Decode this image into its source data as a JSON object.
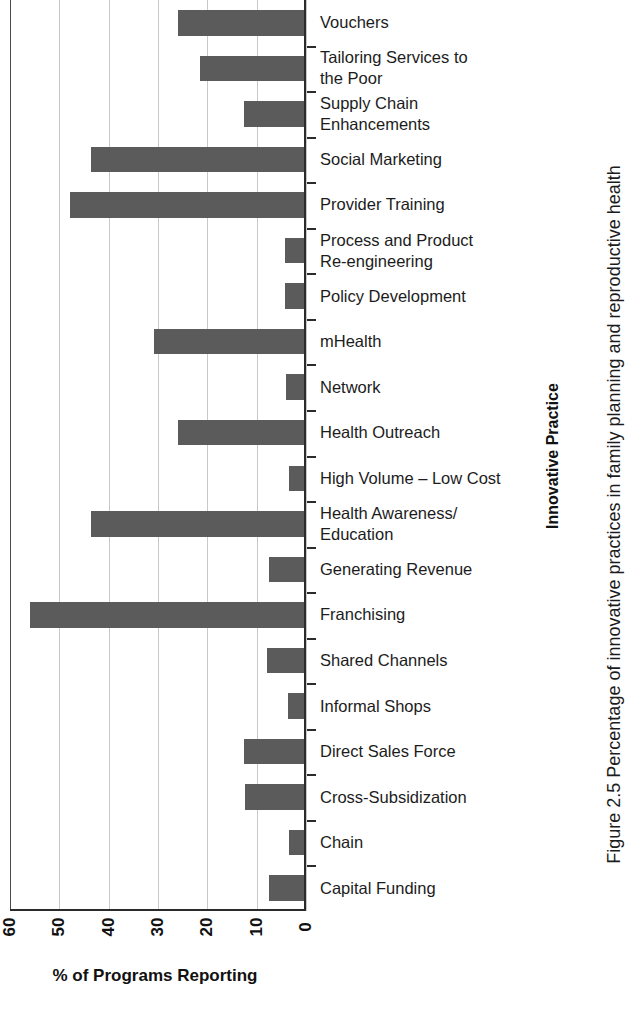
{
  "figure": {
    "caption": "Figure 2.5 Percentage of innovative practices in family planning and reproductive health"
  },
  "chart_data": {
    "type": "bar",
    "orientation": "horizontal",
    "title": "",
    "xlabel": "% of Programs Reporting",
    "ylabel": "Innovative Practice",
    "xlim": [
      60,
      0
    ],
    "x_axis_reversed": true,
    "xticks": [
      "60",
      "50",
      "40",
      "30",
      "20",
      "10",
      "0"
    ],
    "xtick_values": [
      60,
      50,
      40,
      30,
      20,
      10,
      0
    ],
    "grid": true,
    "legend": "none",
    "bar_color": "#5b5b5b",
    "categories": [
      "Vouchers",
      "Tailoring Services to\nthe Poor",
      "Supply Chain\nEnhancements",
      "Social Marketing",
      "Provider Training",
      "Process and Product\nRe-engineering",
      "Policy Development",
      "mHealth",
      "Network",
      "Health Outreach",
      "High Volume – Low Cost",
      "Health Awareness/\nEducation",
      "Generating Revenue",
      "Franchising",
      "Shared Channels",
      "Informal Shops",
      "Direct Sales Force",
      "Cross-Subsidization",
      "Chain",
      "Capital Funding"
    ],
    "values": [
      26.0,
      21.5,
      12.6,
      43.5,
      47.8,
      4.2,
      4.2,
      30.8,
      4.0,
      26.0,
      3.5,
      43.5,
      7.5,
      56.0,
      8.0,
      3.7,
      12.6,
      12.4,
      3.5,
      7.6
    ]
  }
}
